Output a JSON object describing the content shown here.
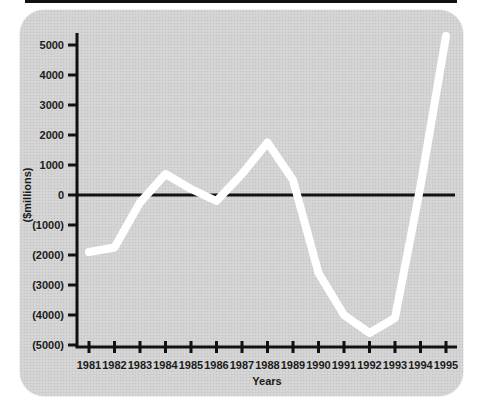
{
  "panel": {
    "background_color": "#d6d6d6",
    "dot_color": "#c6c6c6",
    "axis_color": "#111111",
    "line_color": "#ffffff"
  },
  "chart_data": {
    "type": "line",
    "title": "",
    "xlabel": "Years",
    "ylabel": "($millions)",
    "categories": [
      "1981",
      "1982",
      "1983",
      "1984",
      "1985",
      "1986",
      "1987",
      "1988",
      "1989",
      "1990",
      "1991",
      "1992",
      "1993",
      "1994",
      "1995"
    ],
    "series": [
      {
        "name": "net-income",
        "color": "#ffffff",
        "values": [
          -1900,
          -1750,
          -250,
          700,
          200,
          -200,
          700,
          1750,
          500,
          -2600,
          -4000,
          -4600,
          -4100,
          300,
          5300
        ]
      }
    ],
    "y_ticks": [
      5000,
      4000,
      3000,
      2000,
      1000,
      0,
      -1000,
      -2000,
      -3000,
      -4000,
      -5000
    ],
    "y_tick_labels": [
      "5000",
      "4000",
      "3000",
      "2000",
      "1000",
      "0",
      "(1000)",
      "(2000)",
      "(3000)",
      "(4000)",
      "(5000)"
    ],
    "ylim": [
      -5000,
      5000
    ],
    "grid": false,
    "zero_line": true,
    "legend": "none"
  }
}
